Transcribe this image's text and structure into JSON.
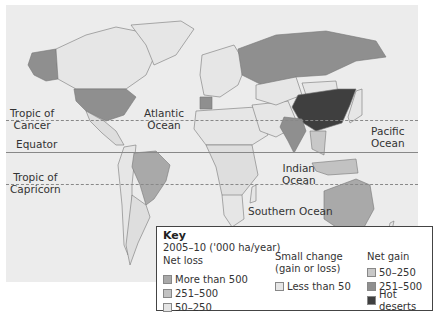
{
  "map": {
    "labels": {
      "tropic_cancer": [
        "Tropic of",
        "Cancer"
      ],
      "equator": "Equator",
      "tropic_capricorn": [
        "Tropic of",
        "Capricorn"
      ],
      "atlantic": [
        "Atlantic",
        "Ocean"
      ],
      "indian": [
        "Indian",
        "Ocean"
      ],
      "pacific": [
        "Pacific",
        "Ocean"
      ],
      "southern": "Southern Ocean"
    },
    "colors": {
      "background": "#ececec",
      "land_small_change": "#e6e6e6",
      "loss_more_500": "#a9a9a9",
      "loss_251_500": "#c2c2c2",
      "loss_50_250": "#dedede",
      "gain_50_250": "#c8c8c8",
      "gain_251_500": "#8f8f8f",
      "hot_deserts": "#3f3f3f"
    },
    "regions": [
      {
        "name": "Alaska/USA",
        "category": "gain_251_500"
      },
      {
        "name": "Canada",
        "category": "small_change"
      },
      {
        "name": "Greenland",
        "category": "small_change"
      },
      {
        "name": "Brazil",
        "category": "loss_more_500"
      },
      {
        "name": "Russia",
        "category": "gain_251_500"
      },
      {
        "name": "China",
        "category": "hot_deserts"
      },
      {
        "name": "India",
        "category": "gain_251_500"
      },
      {
        "name": "Australia",
        "category": "loss_more_500"
      }
    ]
  },
  "key": {
    "title": "Key",
    "period": "2005–10 ('000 ha/year)",
    "net_loss": {
      "heading": "Net loss",
      "items": [
        {
          "label": "More than 500",
          "color": "#a9a9a9"
        },
        {
          "label": "251–500",
          "color": "#c2c2c2"
        },
        {
          "label": "50–250",
          "color": "#e4e4e4"
        }
      ]
    },
    "small_change": {
      "heading": [
        "Small change",
        "(gain or loss)"
      ],
      "items": [
        {
          "label": "Less than 50",
          "color": "#e6e6e6"
        }
      ]
    },
    "net_gain": {
      "heading": "Net gain",
      "items": [
        {
          "label": "50–250",
          "color": "#c8c8c8"
        },
        {
          "label": "251–500",
          "color": "#8f8f8f"
        },
        {
          "label": "Hot deserts",
          "color": "#3f3f3f"
        }
      ]
    }
  }
}
